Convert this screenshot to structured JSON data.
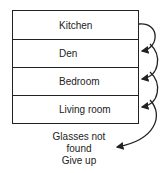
{
  "rooms": [
    {
      "label": "Kitchen"
    },
    {
      "label": "Den"
    },
    {
      "label": "Bedroom"
    },
    {
      "label": "Living room"
    }
  ],
  "result": {
    "line1": "Glasses not found",
    "line2": "Give up"
  }
}
